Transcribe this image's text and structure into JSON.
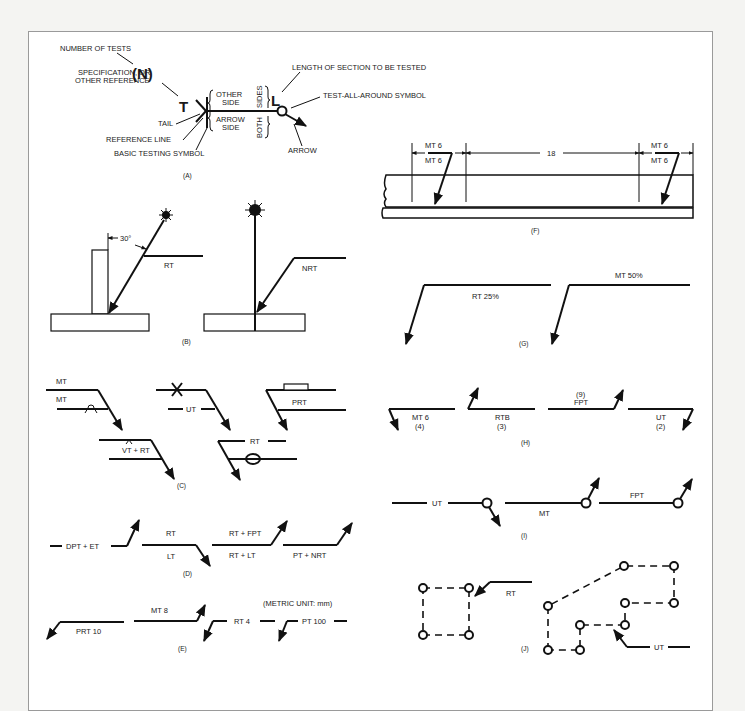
{
  "figure": {
    "panels": {
      "A": {
        "caption": "(A)",
        "labels": {
          "number_of_tests": "NUMBER OF TESTS",
          "n_symbol": "(N)",
          "specification_1": "SPECIFICATION, OR",
          "specification_2": "OTHER REFERENCE",
          "t_symbol": "T",
          "tail": "TAIL",
          "reference_line": "REFERENCE LINE",
          "basic_testing_symbol": "BASIC TESTING SYMBOL",
          "other_side_1": "OTHER",
          "other_side_2": "SIDE",
          "arrow_side_1": "ARROW",
          "arrow_side_2": "SIDE",
          "sides": "SIDES",
          "both": "BOTH",
          "l_symbol": "L",
          "length_of_section": "LENGTH OF SECTION TO BE TESTED",
          "test_all_around": "TEST-ALL-AROUND SYMBOL",
          "arrow": "ARROW"
        }
      },
      "B": {
        "caption": "(B)",
        "angle": "30°",
        "left_method": "RT",
        "right_method": "NRT"
      },
      "C": {
        "caption": "(C)",
        "symbols": [
          "MT",
          "MT",
          "UT",
          "PRT",
          "VT + RT",
          "RT"
        ]
      },
      "D": {
        "caption": "(D)",
        "symbols": [
          "DPT + ET",
          "RT",
          "LT",
          "RT + FPT",
          "RT + LT",
          "PT + NRT"
        ]
      },
      "E": {
        "caption": "(E)",
        "note": "(METRIC UNIT: mm)",
        "symbols": [
          "PRT 10",
          "MT 8",
          "RT 4",
          "PT 100"
        ]
      },
      "F": {
        "caption": "(F)",
        "left_top": "MT 6",
        "left_bottom": "MT 6",
        "spacing": "18",
        "right_top": "MT 6",
        "right_bottom": "MT 6"
      },
      "G": {
        "caption": "(G)",
        "symbols": [
          "RT 25%",
          "MT 50%"
        ]
      },
      "H": {
        "caption": "(H)",
        "symbols": [
          {
            "method": "MT 6",
            "count": "(4)"
          },
          {
            "method": "RTB",
            "count": "(3)"
          },
          {
            "method": "FPT",
            "count": "(9)"
          },
          {
            "method": "UT",
            "count": "(2)"
          }
        ]
      },
      "I": {
        "caption": "(I)",
        "symbols": [
          "UT",
          "MT",
          "FPT"
        ]
      },
      "J": {
        "caption": "(J)",
        "symbols": [
          "RT",
          "UT"
        ]
      }
    },
    "colors": {
      "ink": "#111111",
      "paper": "#ffffff",
      "frame_border": "#9a9a9a",
      "background": "#f4f4f2"
    }
  }
}
